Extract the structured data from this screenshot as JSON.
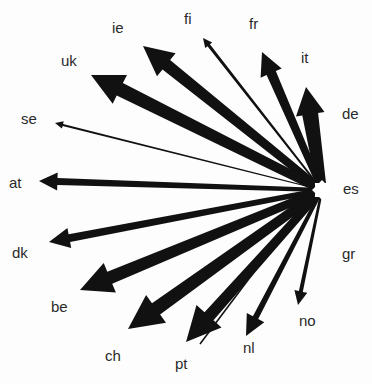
{
  "diagram": {
    "type": "flow-star",
    "hub": {
      "code": "es",
      "x": 322,
      "y": 190,
      "label_x": 343,
      "label_y": 181
    },
    "colors": {
      "arrow": "#111111",
      "label": "#2a2a2a",
      "background": "#fdfdfd",
      "hub": "#ffffff"
    },
    "flows": [
      {
        "code": "de",
        "tip": [
          316,
          140
        ],
        "width": 3,
        "head": 9,
        "label": [
          342,
          106
        ]
      },
      {
        "code": "it",
        "tip": [
          306,
          87
        ],
        "width": 16,
        "head": 24,
        "label": [
          301,
          50
        ]
      },
      {
        "code": "fr",
        "tip": [
          262,
          52
        ],
        "width": 10,
        "head": 20,
        "label": [
          249,
          16
        ]
      },
      {
        "code": "fi",
        "tip": [
          203,
          38
        ],
        "width": 3,
        "head": 8,
        "label": [
          184,
          11
        ]
      },
      {
        "code": "ie",
        "tip": [
          143,
          46
        ],
        "width": 12,
        "head": 26,
        "label": [
          112,
          20
        ]
      },
      {
        "code": "uk",
        "tip": [
          91,
          75
        ],
        "width": 14,
        "head": 28,
        "label": [
          61,
          53
        ]
      },
      {
        "code": "se",
        "tip": [
          55,
          123
        ],
        "width": 2,
        "head": 7,
        "label": [
          21,
          111
        ]
      },
      {
        "code": "at",
        "tip": [
          39,
          181
        ],
        "width": 7,
        "head": 16,
        "label": [
          9,
          175
        ]
      },
      {
        "code": "dk",
        "tip": [
          49,
          242
        ],
        "width": 8,
        "head": 18,
        "label": [
          12,
          245
        ]
      },
      {
        "code": "be",
        "tip": [
          80,
          290
        ],
        "width": 13,
        "head": 28,
        "label": [
          51,
          299
        ]
      },
      {
        "code": "ch",
        "tip": [
          128,
          329
        ],
        "width": 14,
        "head": 30,
        "label": [
          105,
          348
        ]
      },
      {
        "code": "pt",
        "tip": [
          186,
          342
        ],
        "width": 12,
        "head": 30,
        "label": [
          175,
          356
        ]
      },
      {
        "code": "nl",
        "tip": [
          246,
          336
        ],
        "width": 6,
        "head": 18,
        "label": [
          243,
          340
        ]
      },
      {
        "code": "no",
        "tip": [
          298,
          305
        ],
        "width": 4,
        "head": 12,
        "label": [
          299,
          313
        ]
      }
    ],
    "extra_lines": [
      {
        "from": [
          308,
          200
        ],
        "to": [
          200,
          344
        ],
        "width": 1.5
      }
    ],
    "unconnected_labels": [
      {
        "code": "gr",
        "label": [
          342,
          246
        ]
      }
    ]
  }
}
